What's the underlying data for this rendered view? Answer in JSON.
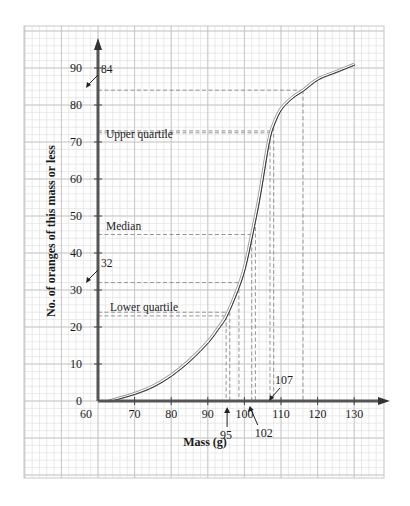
{
  "chart_data": {
    "type": "line",
    "title": "",
    "xlabel": "Mass (g)",
    "ylabel": "No. of oranges of this mass or less",
    "xlim": [
      60,
      135
    ],
    "ylim": [
      0,
      95
    ],
    "grid": true,
    "x_ticks": [
      60,
      70,
      80,
      90,
      100,
      110,
      120,
      130
    ],
    "y_ticks": [
      0,
      10,
      20,
      30,
      40,
      50,
      60,
      70,
      80,
      90
    ],
    "series": [
      {
        "name": "Cumulative frequency",
        "x": [
          63,
          70,
          75,
          80,
          85,
          90,
          93,
          95,
          98,
          100,
          102,
          104,
          106,
          107,
          108,
          110,
          113,
          116,
          120,
          125,
          130
        ],
        "y": [
          0,
          2,
          4,
          7,
          11,
          16,
          20,
          23,
          30,
          36,
          45,
          55,
          67,
          72,
          75,
          79,
          82,
          84,
          87,
          89,
          91
        ]
      }
    ],
    "annotations": [
      {
        "label": "Upper quartile",
        "y": 72.5,
        "x": 107
      },
      {
        "label": "Median",
        "y": 45,
        "x": 102
      },
      {
        "label": "Lower quartile",
        "y": 23,
        "x": 95
      },
      {
        "label": "84",
        "y": 84,
        "x": 116
      },
      {
        "label": "32",
        "y": 32,
        "x": 98.5
      },
      {
        "label": "95",
        "x": 95,
        "axis": "x"
      },
      {
        "label": "102",
        "x": 102,
        "axis": "x"
      },
      {
        "label": "107",
        "x": 107,
        "axis": "x"
      }
    ],
    "extra_dashed_verticals": [
      96,
      103,
      108
    ]
  }
}
